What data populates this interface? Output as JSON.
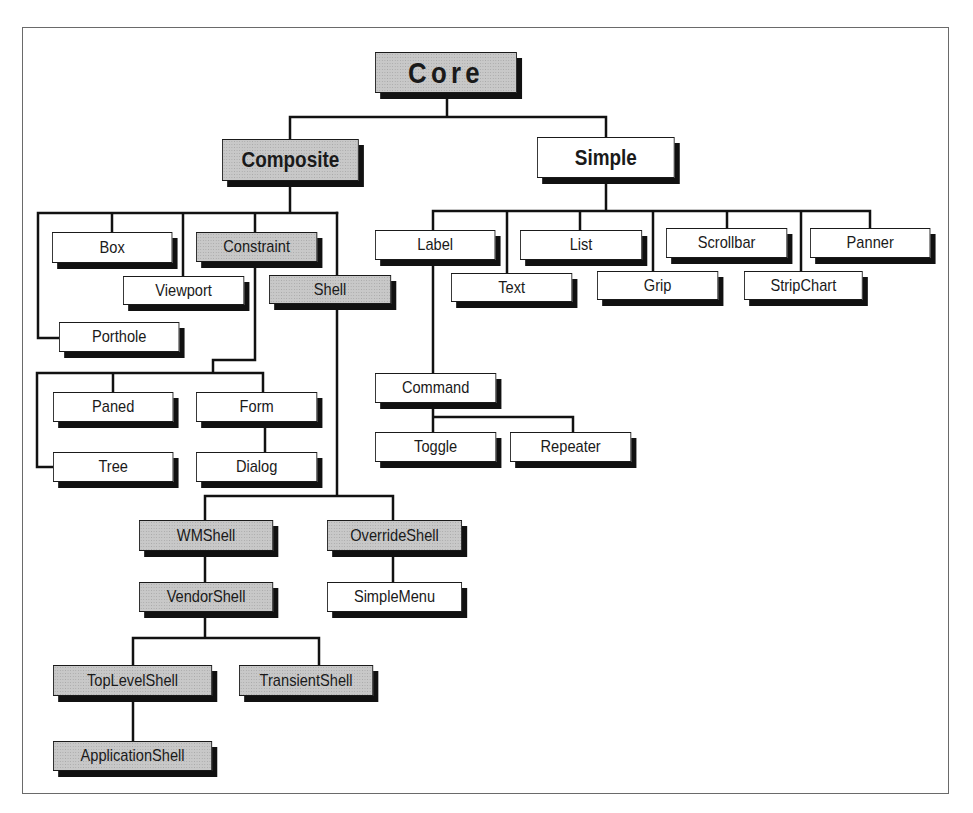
{
  "diagram": {
    "colors": {
      "line": "#111111",
      "box_border": "#1a1a1a",
      "shadow": "#111111",
      "gray_fill": "#c8c8c8",
      "white_fill": "#ffffff",
      "frame": "#6a6a6a"
    },
    "nodes": {
      "core": {
        "label": "Core",
        "parent": null,
        "fill": "gray"
      },
      "composite": {
        "label": "Composite",
        "parent": "Core",
        "fill": "gray"
      },
      "simple": {
        "label": "Simple",
        "parent": "Core",
        "fill": "white"
      },
      "box": {
        "label": "Box",
        "parent": "Composite",
        "fill": "white"
      },
      "constraint": {
        "label": "Constraint",
        "parent": "Composite",
        "fill": "gray"
      },
      "viewport": {
        "label": "Viewport",
        "parent": "Composite",
        "fill": "white"
      },
      "shell": {
        "label": "Shell",
        "parent": "Composite",
        "fill": "gray"
      },
      "porthole": {
        "label": "Porthole",
        "parent": "Composite",
        "fill": "white"
      },
      "paned": {
        "label": "Paned",
        "parent": "Constraint",
        "fill": "white"
      },
      "form": {
        "label": "Form",
        "parent": "Constraint",
        "fill": "white"
      },
      "tree": {
        "label": "Tree",
        "parent": "Constraint",
        "fill": "white"
      },
      "dialog": {
        "label": "Dialog",
        "parent": "Form",
        "fill": "white"
      },
      "wmshell": {
        "label": "WMShell",
        "parent": "Shell",
        "fill": "gray"
      },
      "overrideshell": {
        "label": "OverrideShell",
        "parent": "Shell",
        "fill": "gray"
      },
      "vendorshell": {
        "label": "VendorShell",
        "parent": "WMShell",
        "fill": "gray"
      },
      "simplemenu": {
        "label": "SimpleMenu",
        "parent": "OverrideShell",
        "fill": "white"
      },
      "toplevelshell": {
        "label": "TopLevelShell",
        "parent": "VendorShell",
        "fill": "gray"
      },
      "transientshell": {
        "label": "TransientShell",
        "parent": "VendorShell",
        "fill": "gray"
      },
      "applicationshell": {
        "label": "ApplicationShell",
        "parent": "TopLevelShell",
        "fill": "gray"
      },
      "label": {
        "label": "Label",
        "parent": "Simple",
        "fill": "white"
      },
      "text": {
        "label": "Text",
        "parent": "Simple",
        "fill": "white"
      },
      "list": {
        "label": "List",
        "parent": "Simple",
        "fill": "white"
      },
      "grip": {
        "label": "Grip",
        "parent": "Simple",
        "fill": "white"
      },
      "scrollbar": {
        "label": "Scrollbar",
        "parent": "Simple",
        "fill": "white"
      },
      "stripchart": {
        "label": "StripChart",
        "parent": "Simple",
        "fill": "white"
      },
      "panner": {
        "label": "Panner",
        "parent": "Simple",
        "fill": "white"
      },
      "command": {
        "label": "Command",
        "parent": "Label",
        "fill": "white"
      },
      "toggle": {
        "label": "Toggle",
        "parent": "Command",
        "fill": "white"
      },
      "repeater": {
        "label": "Repeater",
        "parent": "Command",
        "fill": "white"
      }
    }
  }
}
